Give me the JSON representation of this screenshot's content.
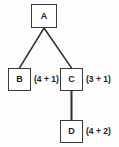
{
  "diagram": {
    "type": "tree",
    "title": "",
    "background_color": "#fdfdfd",
    "line_color": "#2f2f2f",
    "box_border_color": "#3a3a3a",
    "box_fill_color": "#ffffff",
    "text_color": "#1c1c1c",
    "nodes": [
      {
        "id": "A",
        "label": "A",
        "annotation": ""
      },
      {
        "id": "B",
        "label": "B",
        "annotation": "(4 + 1)"
      },
      {
        "id": "C",
        "label": "C",
        "annotation": "(3 + 1)"
      },
      {
        "id": "D",
        "label": "D",
        "annotation": "(4 + 2)"
      }
    ],
    "edges": [
      {
        "from": "A",
        "to": "B"
      },
      {
        "from": "A",
        "to": "C"
      },
      {
        "from": "C",
        "to": "D"
      }
    ]
  }
}
